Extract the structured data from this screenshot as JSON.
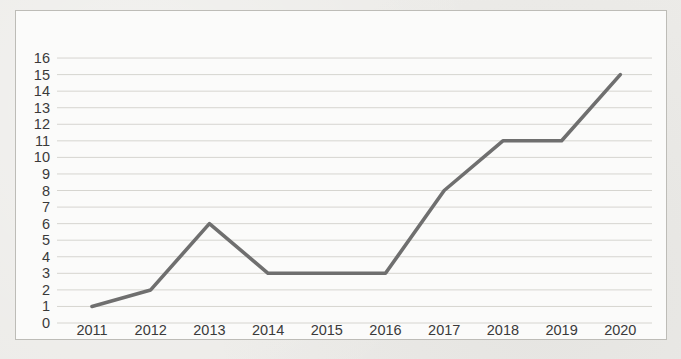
{
  "chart_data": {
    "type": "line",
    "title": "",
    "xlabel": "",
    "ylabel": "",
    "categories": [
      "2011",
      "2012",
      "2013",
      "2014",
      "2015",
      "2016",
      "2017",
      "2018",
      "2019",
      "2020"
    ],
    "values": [
      1,
      2,
      6,
      3,
      3,
      3,
      8,
      11,
      11,
      15
    ],
    "ylim": [
      0,
      16
    ],
    "ytick_step": 1,
    "yticks": [
      "0",
      "1",
      "2",
      "3",
      "4",
      "5",
      "6",
      "7",
      "8",
      "9",
      "10",
      "11",
      "12",
      "13",
      "14",
      "15",
      "16"
    ],
    "grid": "horizontal-major",
    "legend": "none",
    "colors": {
      "page_background": "#ecebe8",
      "plot_background": "#fbfbfa",
      "frame_border": "#bdbcb7",
      "gridline": "#d6d5d0",
      "line": "#6f6f6f",
      "tick_text": "#3a3a3a"
    }
  }
}
